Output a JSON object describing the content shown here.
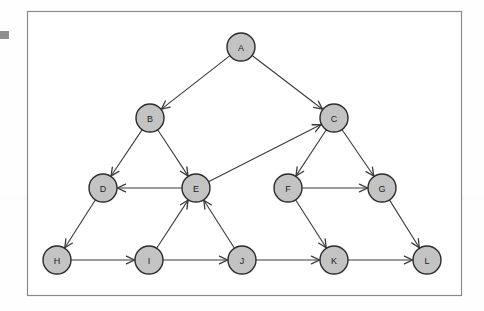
{
  "diagram": {
    "frame": {
      "x": 27,
      "y": 11,
      "width": 434,
      "height": 284,
      "stroke": "#8a8a8a",
      "fill": "#ffffff"
    },
    "background_color": "#fefefe",
    "node_style": {
      "fill": "#c3c3c3",
      "stroke": "#2b2b2b",
      "stroke_width": 1.4,
      "radius": 14,
      "label_color": "#222222"
    },
    "edge_style": {
      "stroke": "#3a3a3a",
      "stroke_width": 1.1,
      "arrowhead": "open-v"
    },
    "left_marker": {
      "color": "#8e8e8e",
      "x": 0,
      "y": 31,
      "width": 9,
      "height": 8
    },
    "nodes": [
      {
        "id": "A",
        "label": "A",
        "x": 241,
        "y": 47
      },
      {
        "id": "B",
        "label": "B",
        "x": 150,
        "y": 118
      },
      {
        "id": "C",
        "label": "C",
        "x": 334,
        "y": 118
      },
      {
        "id": "D",
        "label": "D",
        "x": 103,
        "y": 188
      },
      {
        "id": "E",
        "label": "E",
        "x": 196,
        "y": 188
      },
      {
        "id": "F",
        "label": "F",
        "x": 288,
        "y": 188
      },
      {
        "id": "G",
        "label": "G",
        "x": 382,
        "y": 188
      },
      {
        "id": "H",
        "label": "H",
        "x": 57,
        "y": 260
      },
      {
        "id": "I",
        "label": "I",
        "x": 149,
        "y": 260
      },
      {
        "id": "J",
        "label": "J",
        "x": 242,
        "y": 260
      },
      {
        "id": "K",
        "label": "K",
        "x": 334,
        "y": 260
      },
      {
        "id": "L",
        "label": "L",
        "x": 427,
        "y": 260
      }
    ],
    "edges": [
      {
        "from": "A",
        "to": "B"
      },
      {
        "from": "A",
        "to": "C"
      },
      {
        "from": "B",
        "to": "D"
      },
      {
        "from": "B",
        "to": "E"
      },
      {
        "from": "C",
        "to": "F"
      },
      {
        "from": "C",
        "to": "G"
      },
      {
        "from": "E",
        "to": "C"
      },
      {
        "from": "E",
        "to": "D"
      },
      {
        "from": "D",
        "to": "H"
      },
      {
        "from": "F",
        "to": "G"
      },
      {
        "from": "F",
        "to": "K"
      },
      {
        "from": "G",
        "to": "L"
      },
      {
        "from": "H",
        "to": "I"
      },
      {
        "from": "I",
        "to": "J"
      },
      {
        "from": "I",
        "to": "E"
      },
      {
        "from": "J",
        "to": "E"
      },
      {
        "from": "J",
        "to": "K"
      },
      {
        "from": "K",
        "to": "L"
      }
    ]
  }
}
